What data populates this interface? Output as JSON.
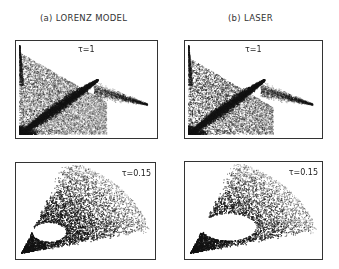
{
  "figure": {
    "columns": [
      {
        "title": "(a) LORENZ MODEL"
      },
      {
        "title": "(b) LASER"
      }
    ],
    "panels": [
      {
        "id": "lorenz-tau1",
        "label": "τ=1",
        "label_pos": "top-center"
      },
      {
        "id": "laser-tau1",
        "label": "τ=1",
        "label_pos": "top-center"
      },
      {
        "id": "lorenz-tau015",
        "label": "τ=0.15",
        "label_pos": "top-right"
      },
      {
        "id": "laser-tau015",
        "label": "τ=0.15",
        "label_pos": "top-right"
      }
    ]
  },
  "chart_data": [
    {
      "type": "scatter",
      "title": "(a) LORENZ MODEL, τ=1",
      "description": "Dense stippled attractor projection: triangular cloud from upper-left spike down to lower-left, with dark diagonal lobe and thin tail extending right",
      "axes": "none",
      "grid": false
    },
    {
      "type": "scatter",
      "title": "(b) LASER, τ=1",
      "description": "Stippled attractor projection similar to Lorenz: triangular cloud with dark diagonal lobe, tail to the right",
      "axes": "none",
      "grid": false
    },
    {
      "type": "scatter",
      "title": "(a) LORENZ MODEL, τ=0.15",
      "description": "Comet-shaped point cloud from lower-left vertex fanning to upper-right with small white hole near vertex",
      "axes": "none",
      "grid": false
    },
    {
      "type": "scatter",
      "title": "(b) LASER, τ=0.15",
      "description": "Comet-shaped point cloud from lower-left vertex with larger white hole, fanning to upper-right",
      "axes": "none",
      "grid": false
    }
  ]
}
